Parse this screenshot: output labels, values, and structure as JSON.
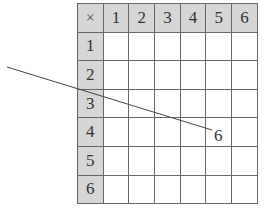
{
  "table": {
    "corner": "×",
    "column_headers": [
      "1",
      "2",
      "3",
      "4",
      "5",
      "6"
    ],
    "row_headers": [
      "1",
      "2",
      "3",
      "4",
      "5",
      "6"
    ],
    "cells": [
      [
        "",
        "",
        "",
        "",
        "",
        ""
      ],
      [
        "",
        "",
        "",
        "",
        "",
        ""
      ],
      [
        "",
        "",
        "",
        "",
        "",
        ""
      ],
      [
        "",
        "",
        "",
        "",
        "",
        ""
      ],
      [
        "",
        "",
        "",
        "",
        "",
        ""
      ],
      [
        "",
        "",
        "",
        "",
        "",
        ""
      ]
    ],
    "header_bg": "#d6d6d6",
    "border_color": "#666666"
  },
  "annotation": {
    "label": "6",
    "line": {
      "x1": 7,
      "y1": 67,
      "x2": 212,
      "y2": 130,
      "color": "#444444"
    }
  }
}
